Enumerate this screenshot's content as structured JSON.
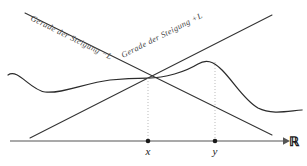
{
  "figure": {
    "background_color": "#ffffff"
  },
  "axis": {
    "name": "real-line",
    "label": "ℝ",
    "color": "#555555",
    "y": 141,
    "x_start": 10,
    "x_end": 285,
    "arrow": true
  },
  "points": [
    {
      "id": "x",
      "label": "x",
      "x": 148,
      "dot_color": "#1a1a1a",
      "dotted_guide": true,
      "guide_top": 78
    },
    {
      "id": "y",
      "label": "y",
      "x": 215,
      "dot_color": "#1a1a1a",
      "dotted_guide": true,
      "guide_top": 62
    }
  ],
  "lines": [
    {
      "id": "slope-minus-L",
      "label": "Gerade der Steigung −L",
      "slope_sign": "-",
      "color": "#333333",
      "x1": 25,
      "y1": 13,
      "x2": 272,
      "y2": 135,
      "label_x": 30,
      "label_y": 20,
      "label_rotate": 26.3
    },
    {
      "id": "slope-plus-L",
      "label": "Gerade der Steigung +L",
      "slope_sign": "+",
      "color": "#333333",
      "x1": 30,
      "y1": 138,
      "x2": 272,
      "y2": 15,
      "label_x": 123,
      "label_y": 58,
      "label_rotate": -26.9
    }
  ],
  "curve": {
    "id": "function-curve",
    "name": "Funktionsgraph",
    "color": "#2b2b2b",
    "path": "M 8 75 C 18 68, 30 90, 45 92 C 62 94, 85 83, 110 80 C 128 78, 140 78, 148 78 C 165 78, 185 72, 198 64 C 206 59, 213 61, 222 70 C 234 82, 244 100, 258 108 C 272 115, 288 111, 302 110",
    "crossing_point": {
      "x": 148,
      "y": 78
    },
    "peak_point": {
      "x": 205,
      "y": 62
    }
  },
  "cone_apex": {
    "x": 148,
    "y": 78
  }
}
